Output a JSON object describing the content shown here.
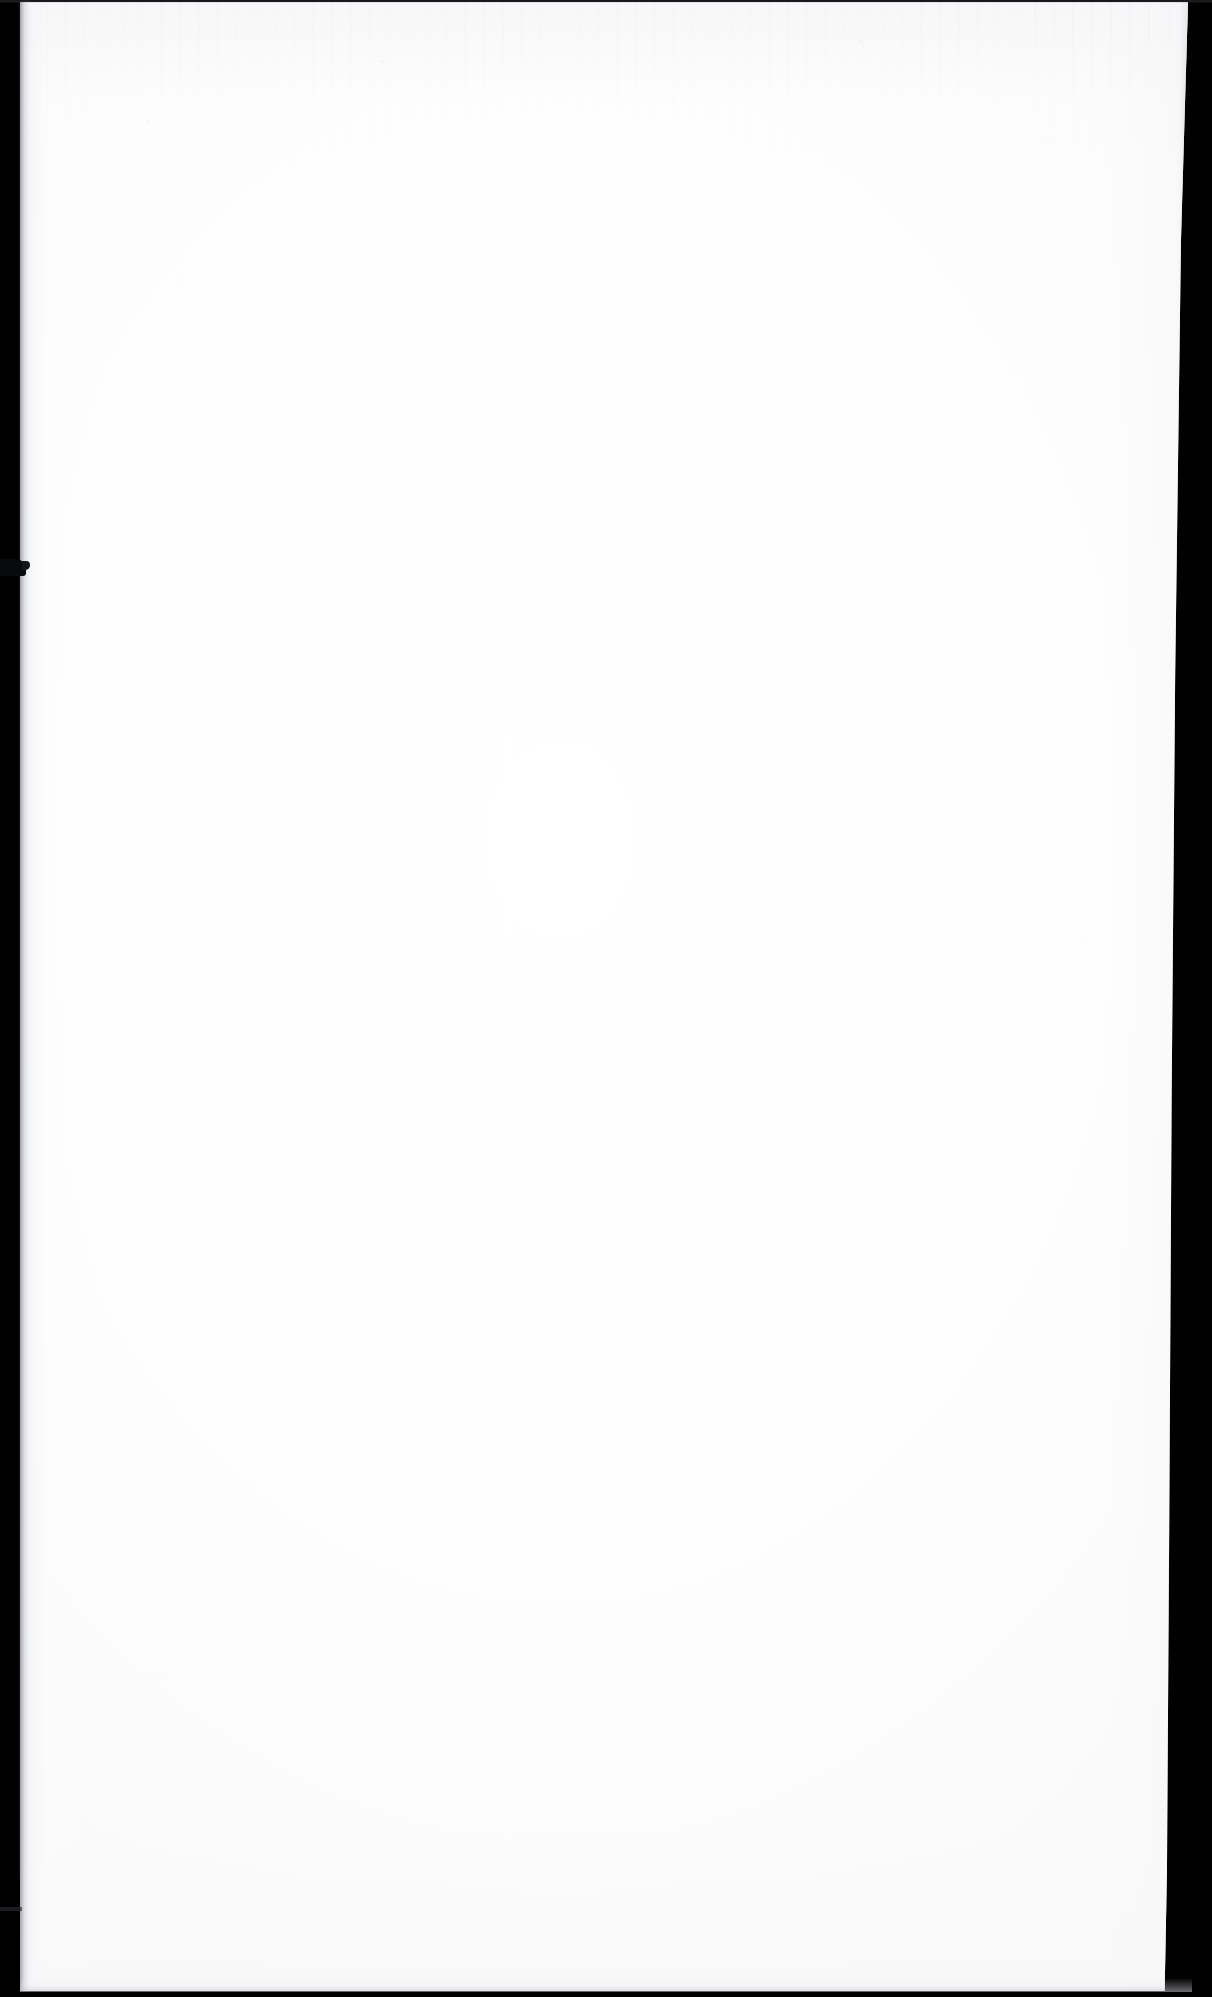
{
  "document": {
    "kind": "scanned-page",
    "page_state": "blank",
    "text_blocks": [],
    "figures": [],
    "tables": [],
    "captions": [],
    "page_number": "",
    "header": "",
    "footer": ""
  },
  "scan": {
    "canvas_width": 1212,
    "canvas_height": 1997,
    "paper_color": "#fdfdfd",
    "surround_color": "#000000",
    "gutter_color": "#000000",
    "edge_shadow_color": "#2b2d33"
  },
  "regions": {
    "gutter_band": "left-binding-gutter",
    "gutter_clip": "binding-clip-artifact",
    "right_edge": "right-page-edge",
    "top_hairline": "top-scan-hairline",
    "bottom_strip": "bottom-scan-strip",
    "paper": "page-sheet"
  }
}
